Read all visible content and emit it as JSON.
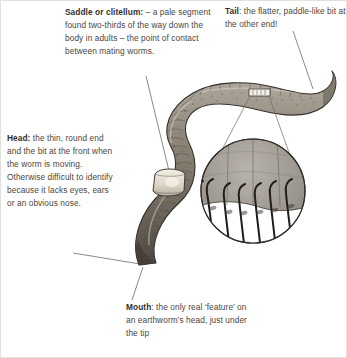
{
  "figure": {
    "subject": "earthworm",
    "background_color": "#ffffff",
    "text_color": "#4a463f",
    "bold_text_color": "#332f2b",
    "leader_line_color": "#6e6a63",
    "worm_body_color": "#8a8378",
    "worm_outline_color": "#3a362f",
    "saddle_color": "#e8e3d8",
    "inset_fill_color": "#9d9890"
  },
  "callouts": [
    {
      "id": "saddle",
      "term": "Saddle or clitellum:",
      "body": " – a pale segment found two-thirds of the way down the body in adults – the point of contact between mating worms."
    },
    {
      "id": "tail",
      "term": "Tail",
      "body": ": the flatter, paddle-like bit at the other end!"
    },
    {
      "id": "head",
      "term": "Head:",
      "body": " the thin, round end and the bit at the front when the worm is moving. Otherwise difficult to identify because it lacks eyes, ears or an obvious nose."
    },
    {
      "id": "mouth",
      "term": "Mouth",
      "body": ": the only real ‘feature’ on an earthworm’s head, just under the tip"
    }
  ],
  "inset": {
    "name": "magnified-bristles-inset",
    "bristle_count": 7,
    "source_marker": "magnifier-box-on-body"
  }
}
